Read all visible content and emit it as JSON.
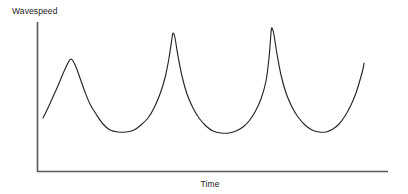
{
  "figure": {
    "background_color": "#ffffff",
    "line_color": "#262626",
    "axis_color": "#595959"
  },
  "labels": {
    "ylabel": "Wavespeed",
    "xlabel": "Time"
  },
  "chart_data": {
    "type": "line",
    "title": "",
    "subtitle": "",
    "xlabel": "Time",
    "ylabel": "Wavespeed",
    "grid": false,
    "legend": false,
    "axis_ticks": false,
    "tick_labels": [],
    "xlim": [
      0,
      10
    ],
    "ylim": [
      0,
      10
    ],
    "x_axis_range_px": [
      37,
      388
    ],
    "y_axis_range_px": [
      172,
      22
    ],
    "peaks": [
      {
        "index": 1,
        "x": 0.95,
        "y": 7.5
      },
      {
        "index": 2,
        "x": 3.85,
        "y": 9.3
      },
      {
        "index": 3,
        "x": 6.65,
        "y": 9.6
      }
    ],
    "troughs": [
      {
        "index": 1,
        "x": 2.35,
        "y": 2.65
      },
      {
        "index": 2,
        "x": 5.2,
        "y": 2.6
      },
      {
        "index": 3,
        "x": 8.0,
        "y": 2.6
      }
    ],
    "start_point": {
      "x": 0.2,
      "y": 3.6
    },
    "end_point": {
      "x": 9.3,
      "y": 7.25
    },
    "series": [
      {
        "name": "wavespeed",
        "points_px": [
          [
            43,
            118
          ],
          [
            47,
            110
          ],
          [
            52,
            99
          ],
          [
            57,
            88
          ],
          [
            62,
            76
          ],
          [
            66,
            67
          ],
          [
            69,
            61
          ],
          [
            71,
            59
          ],
          [
            73,
            61
          ],
          [
            76,
            67
          ],
          [
            80,
            78
          ],
          [
            85,
            92
          ],
          [
            90,
            104
          ],
          [
            96,
            114
          ],
          [
            103,
            124
          ],
          [
            110,
            130
          ],
          [
            118,
            132
          ],
          [
            126,
            132
          ],
          [
            134,
            130
          ],
          [
            141,
            125
          ],
          [
            148,
            118
          ],
          [
            154,
            108
          ],
          [
            160,
            94
          ],
          [
            165,
            78
          ],
          [
            169,
            58
          ],
          [
            172,
            38
          ],
          [
            173,
            33
          ],
          [
            175,
            38
          ],
          [
            178,
            56
          ],
          [
            182,
            76
          ],
          [
            187,
            94
          ],
          [
            193,
            108
          ],
          [
            199,
            118
          ],
          [
            206,
            126
          ],
          [
            213,
            131
          ],
          [
            221,
            133
          ],
          [
            229,
            133
          ],
          [
            236,
            131
          ],
          [
            243,
            127
          ],
          [
            249,
            121
          ],
          [
            255,
            112
          ],
          [
            261,
            99
          ],
          [
            266,
            81
          ],
          [
            269,
            58
          ],
          [
            271,
            33
          ],
          [
            272,
            28
          ],
          [
            274,
            35
          ],
          [
            277,
            54
          ],
          [
            281,
            75
          ],
          [
            286,
            93
          ],
          [
            292,
            107
          ],
          [
            298,
            117
          ],
          [
            305,
            125
          ],
          [
            312,
            130
          ],
          [
            319,
            132
          ],
          [
            326,
            132
          ],
          [
            333,
            129
          ],
          [
            339,
            124
          ],
          [
            345,
            116
          ],
          [
            351,
            105
          ],
          [
            356,
            93
          ],
          [
            360,
            80
          ],
          [
            363,
            69
          ],
          [
            364,
            63
          ]
        ]
      }
    ]
  }
}
